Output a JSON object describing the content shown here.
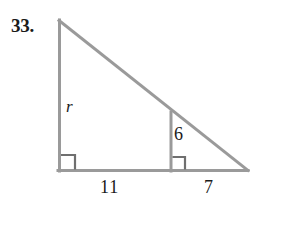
{
  "figure": {
    "exercise_number": "33.",
    "line_color": "#9a9a9a",
    "text_color": "#1a1a1a",
    "background_color": "#ffffff",
    "stroke_width": 3,
    "vertices": {
      "apex": {
        "x": 59,
        "y": 20
      },
      "bottom_left": {
        "x": 59,
        "y": 171
      },
      "bottom_right": {
        "x": 248,
        "y": 171
      },
      "interior_foot": {
        "x": 171,
        "y": 171
      },
      "interior_top": {
        "x": 171,
        "y": 112
      }
    },
    "segments": [
      {
        "name": "left-leg",
        "from": "apex",
        "to": "bottom_left"
      },
      {
        "name": "base",
        "from": "bottom_left",
        "to": "bottom_right"
      },
      {
        "name": "hypotenuse",
        "from": "apex",
        "to": "bottom_right"
      },
      {
        "name": "interior-altitude",
        "from": "interior_top",
        "to": "interior_foot"
      }
    ],
    "right_angle_markers": [
      {
        "name": "bottom-left-right-angle",
        "x": 59,
        "y": 171,
        "size": 14
      },
      {
        "name": "interior-right-angle",
        "x": 171,
        "y": 171,
        "size": 12
      }
    ],
    "labels": {
      "left_leg": "r",
      "interior_leg": "6",
      "base_left_segment": "11",
      "base_right_segment": "7"
    }
  }
}
